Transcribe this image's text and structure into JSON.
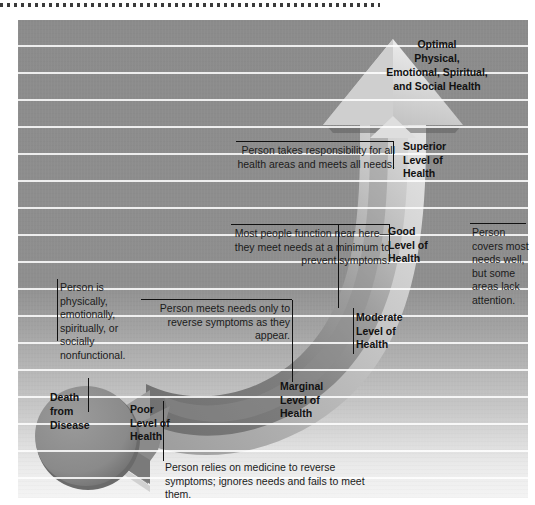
{
  "diagram": {
    "type": "health-continuum",
    "top_rule": "dotted-separator",
    "arrow": {
      "description": "curved double-headed arrow rising from lower-left to upper-right",
      "head_top": "upward triangle arrowhead at top right",
      "head_bottom": "left-pointing arrowhead at lower left"
    }
  },
  "labels": {
    "optimal": "Optimal Physical, Emotional, Spiritual, and Social Health",
    "optimal_lines": [
      "Optimal",
      "Physical,",
      "Emotional, Spiritual,",
      "and Social Health"
    ],
    "superior": "Superior Level of Health",
    "superior_lines": [
      "Superior",
      "Level of",
      "Health"
    ],
    "good": "Good Level of Health",
    "good_lines": [
      "Good",
      "Level of",
      "Health"
    ],
    "moderate": "Moderate Level of Health",
    "moderate_lines": [
      "Moderate",
      "Level of",
      "Health"
    ],
    "marginal": "Marginal Level of Health",
    "marginal_lines": [
      "Marginal",
      "Level of",
      "Health"
    ],
    "poor": "Poor Level of Health",
    "poor_lines": [
      "Poor",
      "Level of",
      "Health"
    ],
    "death": "Death from Disease",
    "death_lines": [
      "Death",
      "from",
      "Disease"
    ]
  },
  "notes": {
    "superior": "Person takes responsibility for all health areas and meets all needs.",
    "most_people": "Most people function near here—they meet needs at a minimum to prevent symptoms.",
    "reverse_symptoms": "Person meets needs only to reverse symptoms as they appear.",
    "nonfunctional": "Person is physically, emotionally, spiritually, or socially nonfunctional.",
    "covers_needs": "Person covers most needs well, but some areas lack attention.",
    "medicine": "Person relies on medicine to reverse symptoms; ignores needs and fails to meet them."
  },
  "colors": {
    "panel_top": "#8b8b8b",
    "panel_bottom": "#f4f4f4",
    "stripe": "#ffffff",
    "arrow_light": "#d2d2d2",
    "arrow_dark": "#777777",
    "circle": "#8a8a8a",
    "circle_shadow": "#5e5e5e",
    "text": "#111111"
  }
}
